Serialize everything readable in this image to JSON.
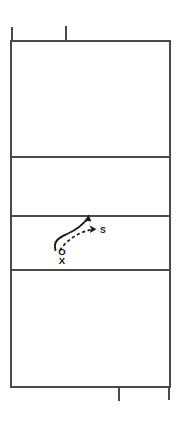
{
  "diagram": {
    "type": "volleyball-court-play-diagram",
    "title": "",
    "court": {
      "left": 11,
      "right": 170,
      "top": 41,
      "bottom": 387,
      "line_color": "#4a4a4a",
      "fill_color": "#ffffff",
      "horizontal_divider_y": [
        157,
        216,
        270
      ],
      "zones": [
        {
          "name": "back-zone-top",
          "top": 41,
          "bottom": 157
        },
        {
          "name": "front-zone-top",
          "top": 157,
          "bottom": 216
        },
        {
          "name": "front-zone-bottom",
          "top": 216,
          "bottom": 270
        },
        {
          "name": "back-zone-bottom",
          "top": 270,
          "bottom": 387
        }
      ],
      "ticks": [
        {
          "name": "top-center-tick",
          "x": 66,
          "y_start": 26,
          "y_end": 41
        },
        {
          "name": "bottom-center-tick",
          "x": 119,
          "y_start": 387,
          "y_end": 401
        },
        {
          "name": "top-left-post-tick",
          "x": 11,
          "y_start": 27,
          "y_end": 41
        },
        {
          "name": "bottom-right-post-tick",
          "x": 170,
          "y_start": 387,
          "y_end": 400
        }
      ]
    },
    "players": [
      {
        "id": "player-o",
        "label": "O",
        "x": 62,
        "y": 252
      },
      {
        "id": "player-x",
        "label": "X",
        "x": 62,
        "y": 261
      }
    ],
    "labels": [
      {
        "id": "setter-label",
        "label": "S",
        "x": 101,
        "y": 230
      }
    ],
    "paths": [
      {
        "id": "movement-path-solid",
        "style": "solid",
        "description": "player movement curving up and forward",
        "d": "M 55 250 C 53 240 62 237 69 234 C 78 230 82 226 88 218",
        "arrowhead": {
          "x": 88,
          "y": 217,
          "angle": -56
        }
      },
      {
        "id": "ball-path-dashed",
        "style": "dashed",
        "description": "ball set toward S",
        "d": "M 60 251 C 64 244 72 237 80 233 C 85 231 89 230 94 229",
        "arrowhead": {
          "x": 95,
          "y": 229,
          "angle": -8
        }
      }
    ],
    "colors": {
      "line": "#4a4a4a",
      "path": "#1a1a1a",
      "background": "#ffffff"
    }
  }
}
